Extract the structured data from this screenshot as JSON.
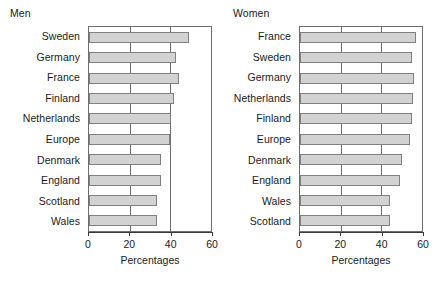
{
  "figure": {
    "background": "#ffffff",
    "bar_fill": "#d2d2d2",
    "bar_edge": "#808080",
    "grid_color": "#6e6e6e"
  },
  "panels": [
    {
      "title": "Men",
      "xlabel": "Percentages",
      "ticks": [
        "0",
        "20",
        "40",
        "60"
      ]
    },
    {
      "title": "Women",
      "xlabel": "Percentages",
      "ticks": [
        "0",
        "20",
        "40",
        "60"
      ]
    }
  ],
  "chart_data": [
    {
      "type": "bar",
      "title": "Men",
      "orientation": "horizontal",
      "xlabel": "Percentages",
      "ylabel": "",
      "xlim": [
        0,
        60
      ],
      "xticks": [
        0,
        20,
        40,
        60
      ],
      "grid": true,
      "legend": "none",
      "categories": [
        "Sweden",
        "Germany",
        "France",
        "Finland",
        "Netherlands",
        "Europe",
        "Denmark",
        "England",
        "Scotland",
        "Wales"
      ],
      "values": [
        49,
        43,
        44.5,
        42,
        40.5,
        40,
        35.5,
        35.5,
        33.5,
        33.5
      ]
    },
    {
      "type": "bar",
      "title": "Women",
      "orientation": "horizontal",
      "xlabel": "Percentages",
      "ylabel": "",
      "xlim": [
        0,
        60
      ],
      "xticks": [
        0,
        20,
        40,
        60
      ],
      "grid": true,
      "legend": "none",
      "categories": [
        "France",
        "Sweden",
        "Germany",
        "Netherlands",
        "Finland",
        "Europe",
        "Denmark",
        "England",
        "Wales",
        "Scotland"
      ],
      "values": [
        57,
        55,
        56,
        55.5,
        55,
        54,
        50,
        49,
        44.5,
        44.5
      ]
    }
  ]
}
